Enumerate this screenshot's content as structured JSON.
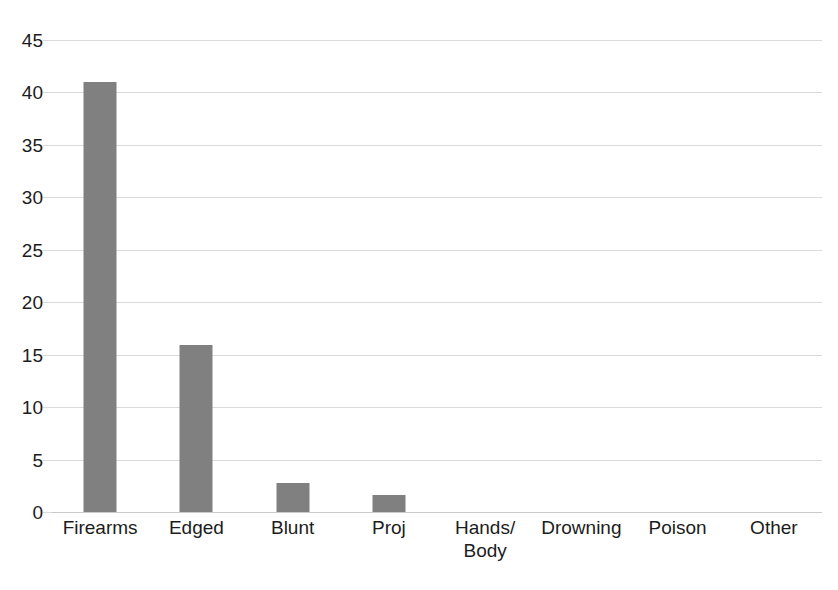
{
  "chart_data": {
    "type": "bar",
    "title": "",
    "subtitle": "",
    "xlabel": "",
    "ylabel": "",
    "categories": [
      "Firearms",
      "Edged",
      "Blunt",
      "Proj",
      "Hands/\nBody",
      "Drowning",
      "Poison",
      "Other"
    ],
    "values": [
      41,
      15.9,
      2.8,
      1.6,
      0,
      0,
      0,
      0
    ],
    "ylim": [
      0,
      45
    ],
    "yticks": [
      0,
      5,
      10,
      15,
      20,
      25,
      30,
      35,
      40,
      45
    ],
    "ytick_labels": [
      "0",
      "5",
      "10",
      "15",
      "20",
      "25",
      "30",
      "35",
      "40",
      "45"
    ],
    "grid": true,
    "legend": false,
    "legend_position": "none",
    "bar_color": "#808080",
    "gridline_color": "#d9dadb",
    "background_color": "#ffffff",
    "text_color": "#1c1c1c"
  }
}
